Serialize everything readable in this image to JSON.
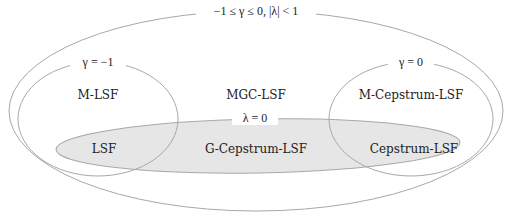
{
  "diagram": {
    "outer": {
      "label": "−1 ≤ γ ≤ 0, |λ| < 1",
      "region_name": "MGC-LSF"
    },
    "left": {
      "label": "γ = −1",
      "region_name": "M-LSF"
    },
    "right": {
      "label": "γ = 0",
      "region_name": "M-Cepstrum-LSF"
    },
    "lambda_zero": {
      "label": "λ = 0",
      "region_name": "G-Cepstrum-LSF"
    },
    "intersections": {
      "left_lambda": "LSF",
      "right_lambda": "Cepstrum-LSF"
    }
  },
  "colors": {
    "stroke": "#a8a8a8",
    "fill_lambda": "#e6e6e6",
    "text": "#222222",
    "background": "#ffffff"
  }
}
